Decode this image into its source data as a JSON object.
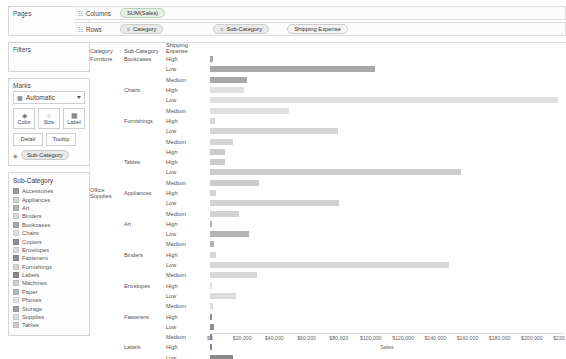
{
  "left_panel": {
    "pages": {
      "title": "Pages"
    },
    "filters": {
      "title": "Filters"
    },
    "marks": {
      "title": "Marks",
      "mark_type": "Automatic",
      "mark_type_icon": "bar-chart-icon",
      "buttons": [
        {
          "label": "Color",
          "icon": "color-icon"
        },
        {
          "label": "Size",
          "icon": "size-icon"
        },
        {
          "label": "Label",
          "icon": "label-icon"
        }
      ],
      "secondary_buttons": [
        {
          "label": "Detail"
        },
        {
          "label": "Tooltip"
        }
      ],
      "color_pill": {
        "label": "Sub-Category",
        "icon": "color-swatch-icon"
      }
    },
    "legend": {
      "title": "Sub-Category",
      "items": [
        {
          "label": "Accessories",
          "color": "#9e9e9e"
        },
        {
          "label": "Appliances",
          "color": "#d2d2d2"
        },
        {
          "label": "Art",
          "color": "#b4b4b4"
        },
        {
          "label": "Binders",
          "color": "#d8d8d8"
        },
        {
          "label": "Bookcases",
          "color": "#a8a8a8"
        },
        {
          "label": "Chairs",
          "color": "#e0e0e0"
        },
        {
          "label": "Copiers",
          "color": "#8f8f8f"
        },
        {
          "label": "Envelopes",
          "color": "#dcdcdc"
        },
        {
          "label": "Fasteners",
          "color": "#909090"
        },
        {
          "label": "Furnishings",
          "color": "#d6d6d6"
        },
        {
          "label": "Labels",
          "color": "#8a8a8a"
        },
        {
          "label": "Machines",
          "color": "#d0d0d0"
        },
        {
          "label": "Paper",
          "color": "#b8b8b8"
        },
        {
          "label": "Phones",
          "color": "#e2e2e2"
        },
        {
          "label": "Storage",
          "color": "#a0a0a0"
        },
        {
          "label": "Supplies",
          "color": "#dadada"
        },
        {
          "label": "Tables",
          "color": "#cccccc"
        }
      ]
    }
  },
  "shelves": {
    "columns": {
      "label": "Columns",
      "pills": [
        {
          "text": "SUM(Sales)",
          "kind": "measure"
        }
      ]
    },
    "rows": {
      "label": "Rows",
      "pills": [
        {
          "text": "Category",
          "kind": "dimension",
          "prefix": "≡"
        },
        {
          "text": "Sub-Category",
          "kind": "dimension",
          "prefix": "≡"
        },
        {
          "text": "Shipping Expense",
          "kind": "plain",
          "prefix": ""
        }
      ]
    }
  },
  "table_headers": {
    "category": "Category",
    "sub_category": "Sub-Category",
    "shipping_expense": "Shipping Expense"
  },
  "chart_data": {
    "type": "bar",
    "title": "",
    "xlabel": "Sales",
    "ylabel": "",
    "xlim": [
      0,
      220000
    ],
    "grid": false,
    "legend_position": "left-sidebar",
    "tick_labels": [
      "$0",
      "$20,000",
      "$40,000",
      "$60,000",
      "$80,000",
      "$100,000",
      "$120,000",
      "$140,000",
      "$160,000",
      "$180,000",
      "$200,000",
      "$220,000"
    ],
    "tick_values": [
      0,
      20000,
      40000,
      60000,
      80000,
      100000,
      120000,
      140000,
      160000,
      180000,
      200000,
      220000
    ],
    "rows": [
      {
        "category": "Furniture",
        "sub_category": "Bookcases",
        "shipping_expense": "High",
        "value": 2000,
        "color": "#a8a8a8"
      },
      {
        "category": "",
        "sub_category": "",
        "shipping_expense": "Low",
        "value": 102000,
        "color": "#a8a8a8"
      },
      {
        "category": "",
        "sub_category": "",
        "shipping_expense": "Medium",
        "value": 23000,
        "color": "#a8a8a8"
      },
      {
        "category": "",
        "sub_category": "Chairs",
        "shipping_expense": "High",
        "value": 21000,
        "color": "#e0e0e0"
      },
      {
        "category": "",
        "sub_category": "",
        "shipping_expense": "Low",
        "value": 215000,
        "color": "#e0e0e0"
      },
      {
        "category": "",
        "sub_category": "",
        "shipping_expense": "Medium",
        "value": 49000,
        "color": "#e0e0e0"
      },
      {
        "category": "",
        "sub_category": "Furnishings",
        "shipping_expense": "High",
        "value": 3000,
        "color": "#d6d6d6"
      },
      {
        "category": "",
        "sub_category": "",
        "shipping_expense": "Low",
        "value": 79000,
        "color": "#d6d6d6"
      },
      {
        "category": "",
        "sub_category": "",
        "shipping_expense": "Medium",
        "value": 14000,
        "color": "#d6d6d6"
      },
      {
        "category": "",
        "sub_category": "",
        "shipping_expense": "High",
        "value": 9000,
        "color": "#cccccc"
      },
      {
        "category": "",
        "sub_category": "Tables",
        "shipping_expense": "High",
        "value": 9000,
        "color": "#cccccc"
      },
      {
        "category": "",
        "sub_category": "",
        "shipping_expense": "Low",
        "value": 155000,
        "color": "#cccccc"
      },
      {
        "category": "",
        "sub_category": "",
        "shipping_expense": "Medium",
        "value": 30000,
        "color": "#cccccc"
      },
      {
        "category": "Office Supplies",
        "sub_category": "Appliances",
        "shipping_expense": "High",
        "value": 4000,
        "color": "#d2d2d2"
      },
      {
        "category": "",
        "sub_category": "",
        "shipping_expense": "Low",
        "value": 80000,
        "color": "#d2d2d2"
      },
      {
        "category": "",
        "sub_category": "",
        "shipping_expense": "Medium",
        "value": 18000,
        "color": "#d2d2d2"
      },
      {
        "category": "",
        "sub_category": "Art",
        "shipping_expense": "High",
        "value": 1000,
        "color": "#b4b4b4"
      },
      {
        "category": "",
        "sub_category": "",
        "shipping_expense": "Low",
        "value": 24000,
        "color": "#b4b4b4"
      },
      {
        "category": "",
        "sub_category": "",
        "shipping_expense": "Medium",
        "value": 2500,
        "color": "#b4b4b4"
      },
      {
        "category": "",
        "sub_category": "Binders",
        "shipping_expense": "High",
        "value": 4000,
        "color": "#d8d8d8"
      },
      {
        "category": "",
        "sub_category": "",
        "shipping_expense": "Low",
        "value": 148000,
        "color": "#d8d8d8"
      },
      {
        "category": "",
        "sub_category": "",
        "shipping_expense": "Medium",
        "value": 29000,
        "color": "#d8d8d8"
      },
      {
        "category": "",
        "sub_category": "Envelopes",
        "shipping_expense": "High",
        "value": 1200,
        "color": "#dcdcdc"
      },
      {
        "category": "",
        "sub_category": "",
        "shipping_expense": "Low",
        "value": 16000,
        "color": "#dcdcdc"
      },
      {
        "category": "",
        "sub_category": "",
        "shipping_expense": "Medium",
        "value": 2000,
        "color": "#dcdcdc"
      },
      {
        "category": "",
        "sub_category": "Fasteners",
        "shipping_expense": "High",
        "value": 600,
        "color": "#909090"
      },
      {
        "category": "",
        "sub_category": "",
        "shipping_expense": "Low",
        "value": 2500,
        "color": "#909090"
      },
      {
        "category": "",
        "sub_category": "",
        "shipping_expense": "Medium",
        "value": 700,
        "color": "#909090"
      },
      {
        "category": "",
        "sub_category": "Labels",
        "shipping_expense": "High",
        "value": 1000,
        "color": "#8a8a8a"
      },
      {
        "category": "",
        "sub_category": "",
        "shipping_expense": "Low",
        "value": 14000,
        "color": "#8a8a8a"
      },
      {
        "category": "",
        "sub_category": "",
        "shipping_expense": "Medium",
        "value": 2200,
        "color": "#8a8a8a"
      }
    ]
  }
}
